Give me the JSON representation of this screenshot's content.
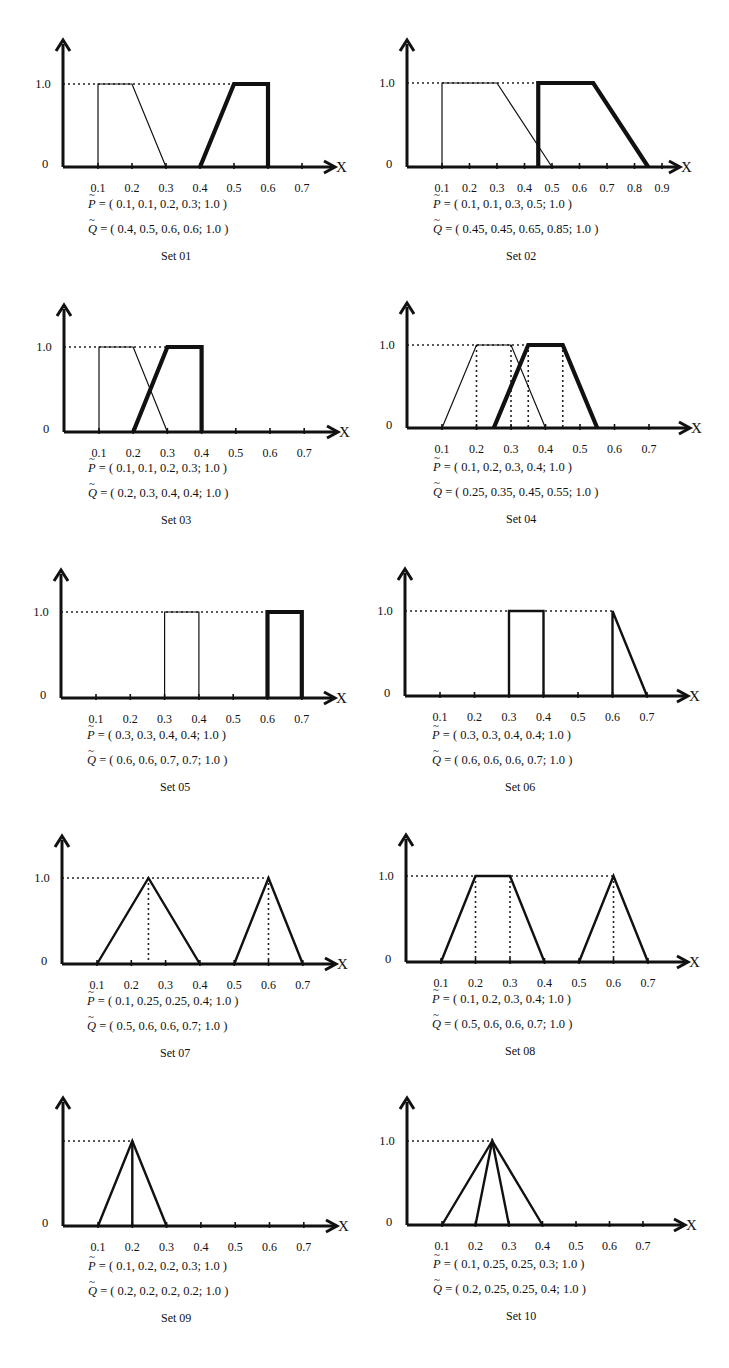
{
  "figure": {
    "p_symbol": "P",
    "q_symbol": "Q",
    "x_axis_symbol": "X",
    "y_tick_one": "1.0",
    "y_tick_zero": "0"
  },
  "chart_data": [
    {
      "type": "line",
      "title": "Set 01",
      "x_ticks": [
        "0.1",
        "0.2",
        "0.3",
        "0.4",
        "0.5",
        "0.6",
        "0.7"
      ],
      "y_ticks": [
        "0",
        "1.0"
      ],
      "xlabel": "X",
      "ylabel": "",
      "series": [
        {
          "name": "P",
          "params": [
            0.1,
            0.1,
            0.2,
            0.3
          ],
          "height": 1.0,
          "stroke": "thin"
        },
        {
          "name": "Q",
          "params": [
            0.4,
            0.5,
            0.6,
            0.6
          ],
          "height": 1.0,
          "stroke": "heavy"
        }
      ],
      "p_text": "= ( 0.1, 0.1, 0.2, 0.3; 1.0 )",
      "q_text": "= ( 0.4, 0.5, 0.6, 0.6; 1.0 )",
      "dotted_verticals": [],
      "layout": {
        "ax": 63,
        "top": 40,
        "y1": 84,
        "y0": 167,
        "scale": 340,
        "xend": 335,
        "capx": 88,
        "capy": 205
      }
    },
    {
      "type": "line",
      "title": "Set 02",
      "x_ticks": [
        "0.1",
        "0.2",
        "0.3",
        "0.4",
        "0.5",
        "0.6",
        "0.7",
        "0.8",
        "0.9"
      ],
      "y_ticks": [
        "0",
        "1.0"
      ],
      "xlabel": "X",
      "ylabel": "",
      "series": [
        {
          "name": "P",
          "params": [
            0.1,
            0.1,
            0.3,
            0.5
          ],
          "height": 1.0,
          "stroke": "thin"
        },
        {
          "name": "Q",
          "params": [
            0.45,
            0.45,
            0.65,
            0.85
          ],
          "height": 1.0,
          "stroke": "heavy"
        }
      ],
      "p_text": "= ( 0.1, 0.1, 0.3, 0.5; 1.0 )",
      "q_text": "= ( 0.45, 0.45, 0.65, 0.85; 1.0 )",
      "dotted_verticals": [],
      "layout": {
        "ax": 407,
        "top": 40,
        "y1": 83,
        "y0": 167,
        "scale": 275,
        "xend": 680,
        "capx": 433,
        "capy": 205
      }
    },
    {
      "type": "line",
      "title": "Set 03",
      "x_ticks": [
        "0.1",
        "0.2",
        "0.3",
        "0.4",
        "0.5",
        "0.6",
        "0.7"
      ],
      "y_ticks": [
        "0",
        "1.0"
      ],
      "xlabel": "X",
      "ylabel": "",
      "series": [
        {
          "name": "P",
          "params": [
            0.1,
            0.1,
            0.2,
            0.3
          ],
          "height": 1.0,
          "stroke": "thin"
        },
        {
          "name": "Q",
          "params": [
            0.2,
            0.3,
            0.4,
            0.4
          ],
          "height": 1.0,
          "stroke": "heavy"
        }
      ],
      "p_text": "= ( 0.1, 0.1, 0.2, 0.3; 1.0 )",
      "q_text": "= ( 0.2, 0.3, 0.4, 0.4; 1.0 )",
      "dotted_verticals": [],
      "layout": {
        "ax": 64,
        "top": 305,
        "y1": 347,
        "y0": 432,
        "scale": 342,
        "xend": 338,
        "capx": 88,
        "capy": 469
      }
    },
    {
      "type": "line",
      "title": "Set 04",
      "x_ticks": [
        "0.1",
        "0.2",
        "0.3",
        "0.4",
        "0.5",
        "0.6",
        "0.7"
      ],
      "y_ticks": [
        "0",
        "1.0"
      ],
      "xlabel": "X",
      "ylabel": "",
      "series": [
        {
          "name": "P",
          "params": [
            0.1,
            0.2,
            0.3,
            0.4
          ],
          "height": 1.0,
          "stroke": "thin"
        },
        {
          "name": "Q",
          "params": [
            0.25,
            0.35,
            0.45,
            0.55
          ],
          "height": 1.0,
          "stroke": "heavy"
        }
      ],
      "p_text": "= ( 0.1, 0.2, 0.3, 0.4; 1.0 )",
      "q_text": "= ( 0.25, 0.35, 0.45, 0.55; 1.0 )",
      "dotted_verticals": [
        0.2,
        0.3,
        0.35,
        0.45
      ],
      "layout": {
        "ax": 407,
        "top": 303,
        "y1": 345,
        "y0": 428,
        "scale": 345,
        "xend": 690,
        "capx": 433,
        "capy": 468
      }
    },
    {
      "type": "line",
      "title": "Set 05",
      "x_ticks": [
        "0.1",
        "0.2",
        "0.3",
        "0.4",
        "0.5",
        "0.6",
        "0.7"
      ],
      "y_ticks": [
        "0",
        "1.0"
      ],
      "xlabel": "X",
      "ylabel": "",
      "series": [
        {
          "name": "P",
          "params": [
            0.3,
            0.3,
            0.4,
            0.4
          ],
          "height": 1.0,
          "stroke": "thin"
        },
        {
          "name": "Q",
          "params": [
            0.6,
            0.6,
            0.7,
            0.7
          ],
          "height": 1.0,
          "stroke": "heavy"
        }
      ],
      "p_text": "= ( 0.3, 0.3, 0.4, 0.4; 1.0 )",
      "q_text": "= ( 0.6, 0.6, 0.7, 0.7; 1.0 )",
      "dotted_verticals": [],
      "layout": {
        "ax": 61,
        "top": 570,
        "y1": 612,
        "y0": 698,
        "scale": 343,
        "xend": 335,
        "capx": 87,
        "capy": 736
      }
    },
    {
      "type": "line",
      "title": "Set 06",
      "x_ticks": [
        "0.1",
        "0.2",
        "0.3",
        "0.4",
        "0.5",
        "0.6",
        "0.7"
      ],
      "y_ticks": [
        "0",
        "1.0"
      ],
      "xlabel": "X",
      "ylabel": "",
      "series": [
        {
          "name": "P",
          "params": [
            0.3,
            0.3,
            0.4,
            0.4
          ],
          "height": 1.0,
          "stroke": "medium"
        },
        {
          "name": "Q",
          "params": [
            0.6,
            0.6,
            0.6,
            0.7
          ],
          "height": 1.0,
          "stroke": "medium"
        }
      ],
      "p_text": "= ( 0.3, 0.3, 0.4, 0.4; 1.0 )",
      "q_text": "= ( 0.6, 0.6, 0.6, 0.7; 1.0 )",
      "dotted_verticals": [],
      "layout": {
        "ax": 405,
        "top": 569,
        "y1": 611,
        "y0": 696,
        "scale": 345,
        "xend": 688,
        "capx": 432,
        "capy": 736
      }
    },
    {
      "type": "line",
      "title": "Set 07",
      "x_ticks": [
        "0.1",
        "0.2",
        "0.3",
        "0.4",
        "0.5",
        "0.6",
        "0.7"
      ],
      "y_ticks": [
        "0",
        "1.0"
      ],
      "xlabel": "X",
      "ylabel": "",
      "series": [
        {
          "name": "P",
          "params": [
            0.1,
            0.25,
            0.25,
            0.4
          ],
          "height": 1.0,
          "stroke": "medium"
        },
        {
          "name": "Q",
          "params": [
            0.5,
            0.6,
            0.6,
            0.7
          ],
          "height": 1.0,
          "stroke": "medium"
        }
      ],
      "p_text": "= ( 0.1, 0.25, 0.25, 0.4; 1.0 )",
      "q_text": "= ( 0.5, 0.6, 0.6, 0.7; 1.0 )",
      "dotted_verticals": [
        0.25,
        0.6
      ],
      "layout": {
        "ax": 62,
        "top": 836,
        "y1": 878,
        "y0": 964,
        "scale": 343,
        "xend": 336,
        "capx": 87,
        "capy": 1002
      }
    },
    {
      "type": "line",
      "title": "Set 08",
      "x_ticks": [
        "0.1",
        "0.2",
        "0.3",
        "0.4",
        "0.5",
        "0.6",
        "0.7"
      ],
      "y_ticks": [
        "0",
        "1.0"
      ],
      "xlabel": "X",
      "ylabel": "",
      "series": [
        {
          "name": "P",
          "params": [
            0.1,
            0.2,
            0.3,
            0.4
          ],
          "height": 1.0,
          "stroke": "medium"
        },
        {
          "name": "Q",
          "params": [
            0.5,
            0.6,
            0.6,
            0.7
          ],
          "height": 1.0,
          "stroke": "medium"
        }
      ],
      "p_text": "= ( 0.1, 0.2, 0.3, 0.4; 1.0 )",
      "q_text": "= ( 0.5, 0.6, 0.6, 0.7; 1.0 )",
      "dotted_verticals": [
        0.2,
        0.3,
        0.6
      ],
      "layout": {
        "ax": 406,
        "top": 835,
        "y1": 876,
        "y0": 962,
        "scale": 345,
        "xend": 688,
        "capx": 432,
        "capy": 1000
      }
    },
    {
      "type": "line",
      "title": "Set 09",
      "x_ticks": [
        "0.1",
        "0.2",
        "0.3",
        "0.4",
        "0.5",
        "0.6",
        "0.7"
      ],
      "y_ticks": [
        "0"
      ],
      "xlabel": "X",
      "ylabel": "",
      "series": [
        {
          "name": "P",
          "params": [
            0.1,
            0.2,
            0.2,
            0.3
          ],
          "height": 1.0,
          "stroke": "medium"
        },
        {
          "name": "Q",
          "params": [
            0.2,
            0.2,
            0.2,
            0.2
          ],
          "height": 1.0,
          "stroke": "medium"
        }
      ],
      "p_text": "= ( 0.1, 0.2, 0.2, 0.3; 1.0 )",
      "q_text": "= ( 0.2, 0.2, 0.2, 0.2; 1.0 )",
      "dotted_verticals": [],
      "hide_one_label": true,
      "layout": {
        "ax": 63,
        "top": 1098,
        "y1": 1141,
        "y0": 1226,
        "scale": 343,
        "xend": 337,
        "capx": 88,
        "capy": 1267
      }
    },
    {
      "type": "line",
      "title": "Set 10",
      "x_ticks": [
        "0.1",
        "0.2",
        "0.3",
        "0.4",
        "0.5",
        "0.6",
        "0.7"
      ],
      "y_ticks": [
        "0",
        "1.0"
      ],
      "xlabel": "X",
      "ylabel": "",
      "series": [
        {
          "name": "P",
          "params": [
            0.1,
            0.25,
            0.25,
            0.3
          ],
          "height": 1.0,
          "stroke": "medium"
        },
        {
          "name": "Q",
          "params": [
            0.2,
            0.25,
            0.25,
            0.4
          ],
          "height": 1.0,
          "stroke": "medium"
        }
      ],
      "p_text": "= ( 0.1, 0.25, 0.25, 0.3; 1.0 )",
      "q_text": "= ( 0.2, 0.25, 0.25, 0.4; 1.0 )",
      "dotted_verticals": [],
      "layout": {
        "ax": 407,
        "top": 1098,
        "y1": 1141,
        "y0": 1225,
        "scale": 335,
        "xend": 685,
        "capx": 433,
        "capy": 1265
      }
    }
  ]
}
